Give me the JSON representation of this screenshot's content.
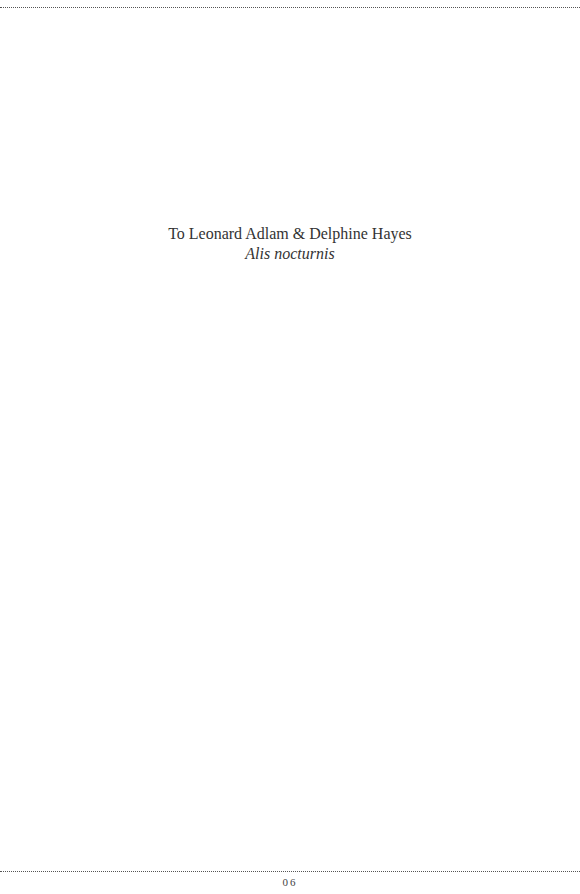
{
  "page": {
    "dedication_line": "To Leonard Adlam & Delphine Hayes",
    "motto": "Alis nocturnis",
    "page_number": "06"
  }
}
